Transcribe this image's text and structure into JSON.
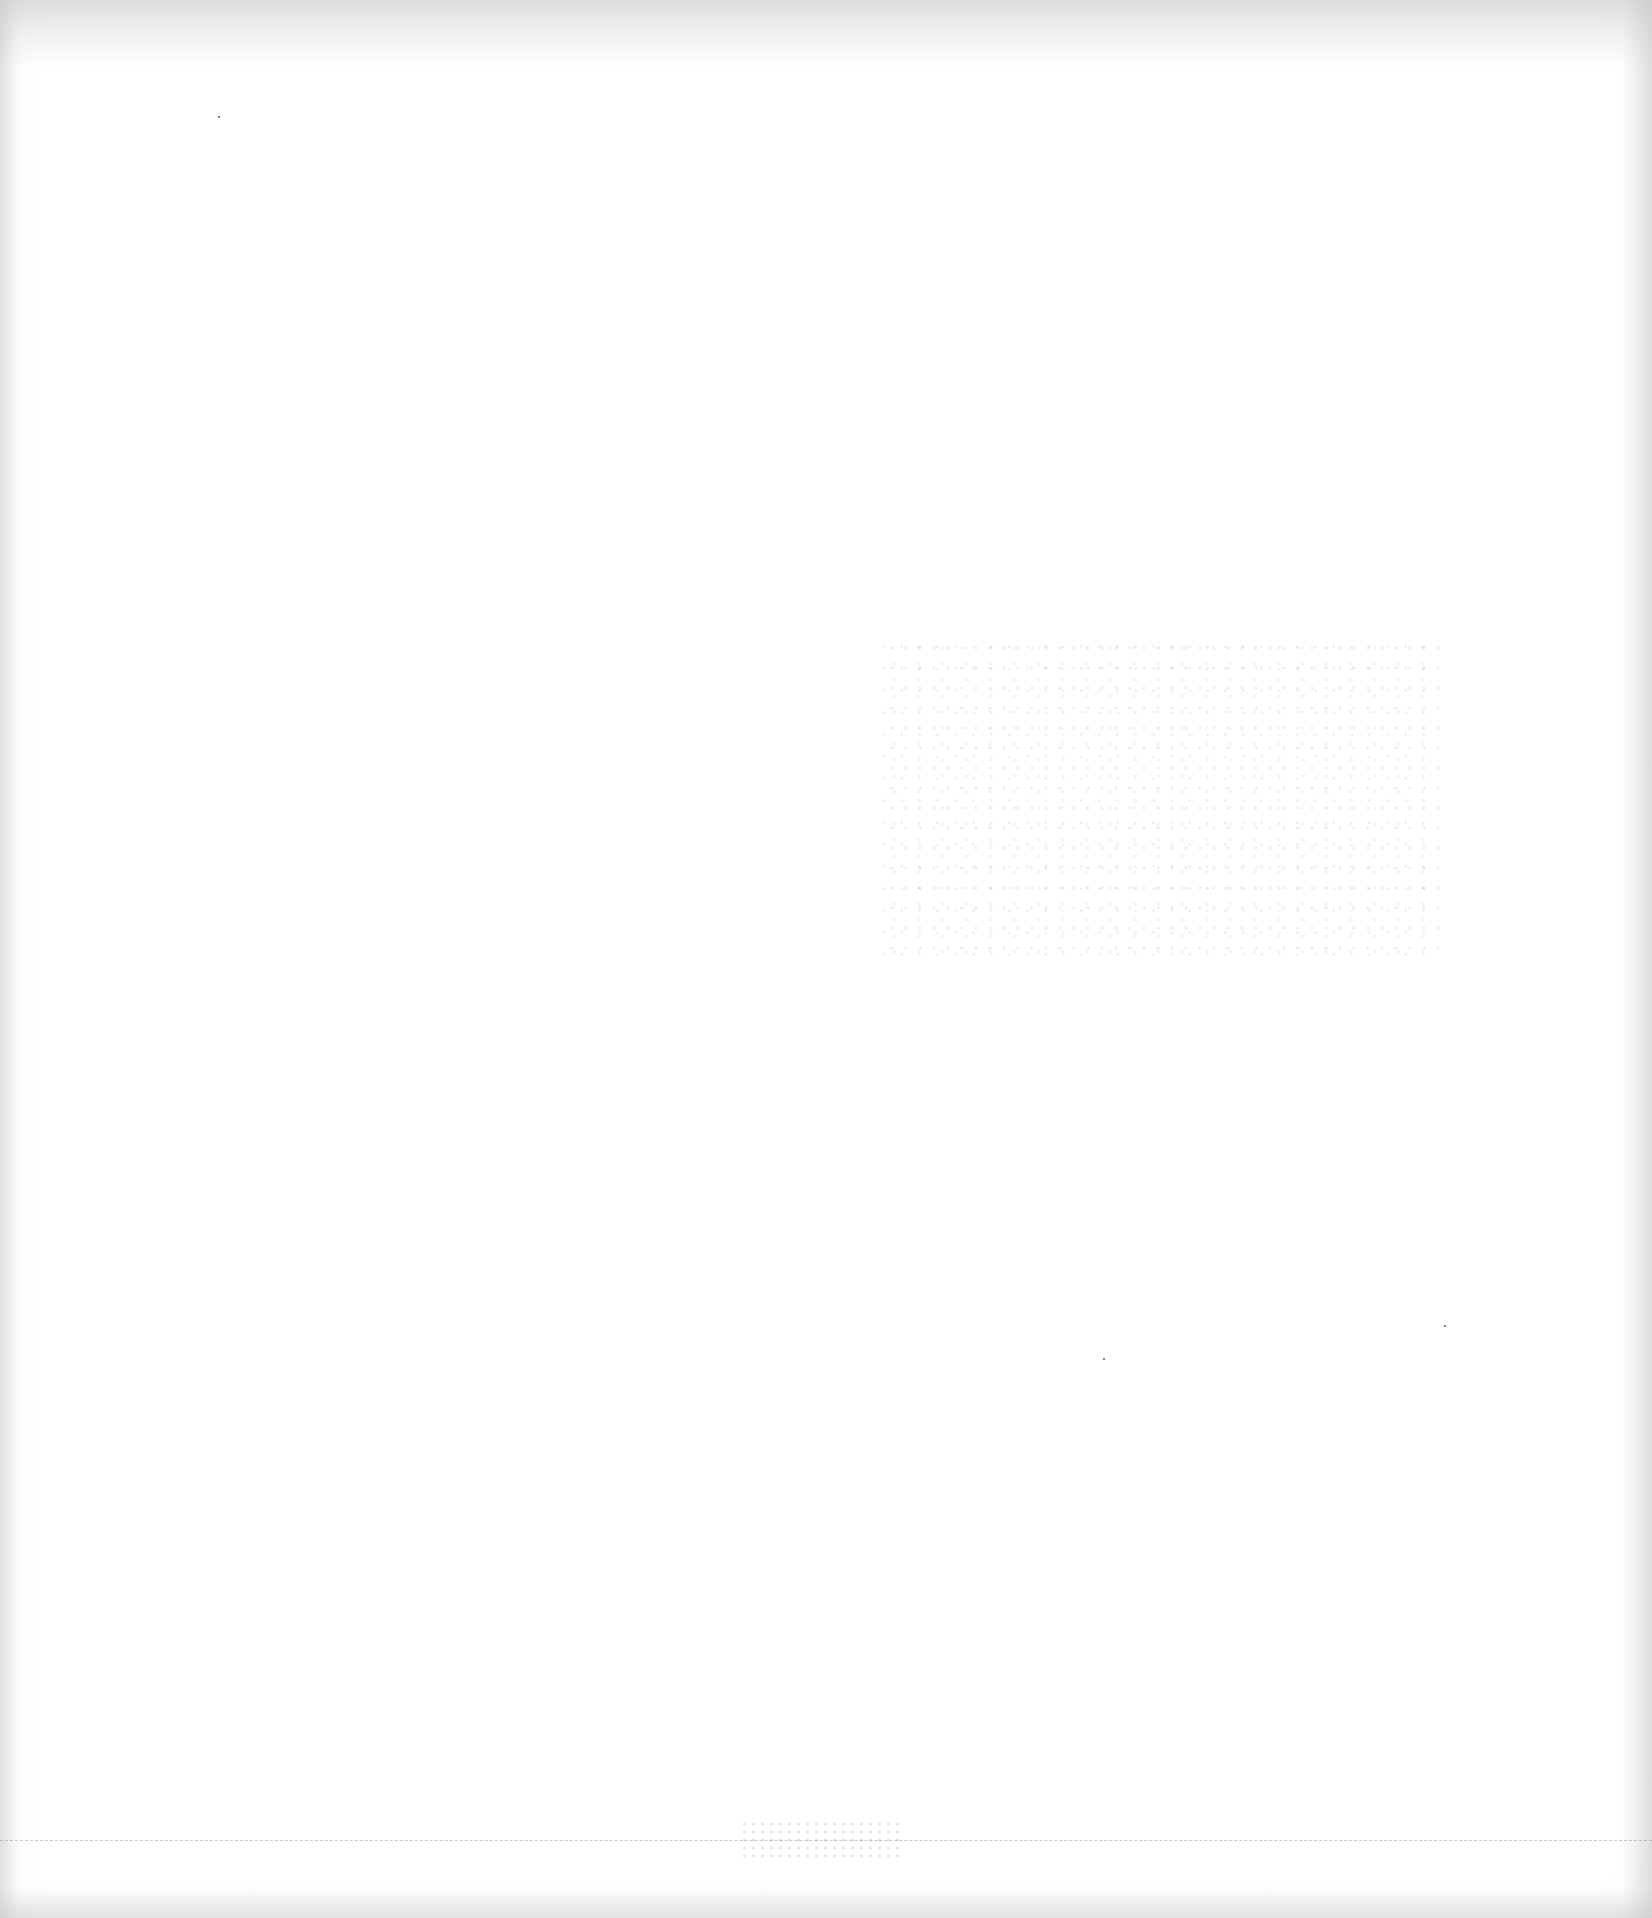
{
  "document": {
    "type": "blank scanned page",
    "visible_text": [],
    "background_color": "#ffffff",
    "edge_shading_color": "#c8c8c8",
    "artifacts": [
      {
        "kind": "bleed-through speckles",
        "region": "center-right"
      },
      {
        "kind": "faint dashed line",
        "region": "bottom"
      },
      {
        "kind": "speckle smudge",
        "region": "bottom-center"
      },
      {
        "kind": "dot",
        "region": "top-left"
      }
    ]
  }
}
